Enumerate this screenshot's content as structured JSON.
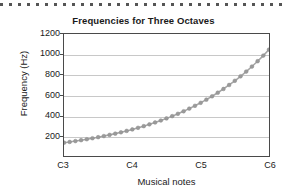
{
  "figure": {
    "top_rule": "dotted-rule",
    "background": "#ffffff"
  },
  "chart_data": {
    "type": "line",
    "title": "Frequencies for Three Octaves",
    "xlabel": "Musical notes",
    "ylabel": "Frequency (Hz)",
    "grid": "horizontal",
    "legend": "none",
    "marker": "filled-circle",
    "marker_color": "#9a9a9a",
    "line_color": "#a6a6a6",
    "axis_color": "#4a4a4a",
    "gridline_color": "#c8c8c8",
    "ylim": [
      0,
      1200
    ],
    "yticks": [
      200,
      400,
      600,
      800,
      1000,
      1200
    ],
    "ytick_labels": [
      "200",
      "400",
      "600",
      "800",
      "1000",
      "1200"
    ],
    "xlim": [
      0,
      36
    ],
    "xticks": [
      0,
      12,
      24,
      36
    ],
    "xtick_labels": [
      "C3",
      "C4",
      "C5",
      "C6"
    ],
    "x": [
      0,
      1,
      2,
      3,
      4,
      5,
      6,
      7,
      8,
      9,
      10,
      11,
      12,
      13,
      14,
      15,
      16,
      17,
      18,
      19,
      20,
      21,
      22,
      23,
      24,
      25,
      26,
      27,
      28,
      29,
      30,
      31,
      32,
      33,
      34,
      35,
      36
    ],
    "values": [
      130.8,
      138.6,
      146.8,
      155.6,
      164.8,
      174.6,
      185.0,
      196.0,
      207.7,
      220.0,
      233.1,
      246.9,
      261.6,
      277.2,
      293.7,
      311.1,
      329.6,
      349.2,
      370.0,
      392.0,
      415.3,
      440.0,
      466.2,
      493.9,
      523.3,
      554.4,
      587.3,
      622.3,
      659.3,
      698.5,
      740.0,
      784.0,
      830.6,
      880.0,
      932.3,
      987.8,
      1046.5
    ],
    "point_labels": [
      "C3",
      "C#3",
      "D3",
      "D#3",
      "E3",
      "F3",
      "F#3",
      "G3",
      "G#3",
      "A3",
      "A#3",
      "B3",
      "C4",
      "C#4",
      "D4",
      "D#4",
      "E4",
      "F4",
      "F#4",
      "G4",
      "G#4",
      "A4",
      "A#4",
      "B4",
      "C5",
      "C#5",
      "D5",
      "D#5",
      "E5",
      "F5",
      "F#5",
      "G5",
      "G#5",
      "A5",
      "A#5",
      "B5",
      "C6"
    ]
  }
}
